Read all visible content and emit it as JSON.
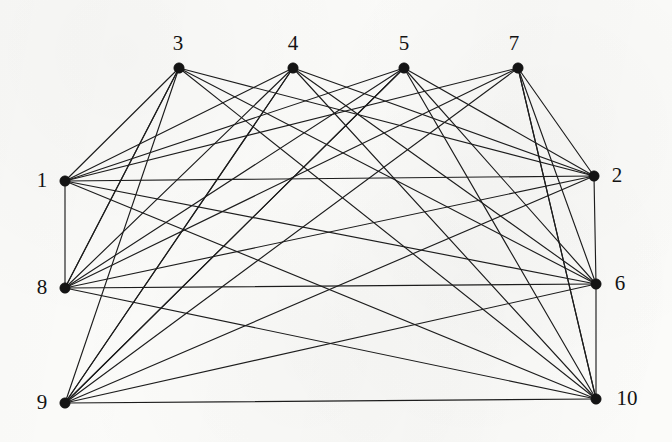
{
  "diagram": {
    "kind": "node-link-graph",
    "background_color": "#fbfbf9",
    "edge_color": "#1d1d1d",
    "vertex_color": "#141414",
    "vertex_radius": 5.2,
    "edge_width": 1.15,
    "label_font_size": 21,
    "width": 672,
    "height": 442
  },
  "chart_data": {
    "type": "scatter",
    "xlabel": "",
    "ylabel": "",
    "grid": false,
    "legend": "none",
    "xlim": [
      0,
      672
    ],
    "ylim": [
      0,
      442
    ],
    "node_count": 10,
    "edge_count": 40,
    "nodes": [
      {
        "id": "1",
        "label": "1",
        "x": 65,
        "y": 181,
        "label_x": 42,
        "label_y": 180,
        "degree": 8
      },
      {
        "id": "2",
        "label": "2",
        "x": 594,
        "y": 176,
        "label_x": 617,
        "label_y": 175,
        "degree": 8
      },
      {
        "id": "3",
        "label": "3",
        "x": 179,
        "y": 68,
        "label_x": 178,
        "label_y": 43,
        "degree": 6
      },
      {
        "id": "4",
        "label": "4",
        "x": 293,
        "y": 68,
        "label_x": 293,
        "label_y": 43,
        "degree": 8
      },
      {
        "id": "5",
        "label": "5",
        "x": 404,
        "y": 68,
        "label_x": 404,
        "label_y": 43,
        "degree": 8
      },
      {
        "id": "7",
        "label": "7",
        "x": 518,
        "y": 68,
        "label_x": 514,
        "label_y": 43,
        "degree": 8
      },
      {
        "id": "6",
        "label": "6",
        "x": 596,
        "y": 284,
        "label_x": 620,
        "label_y": 283,
        "degree": 8
      },
      {
        "id": "8",
        "label": "8",
        "x": 65,
        "y": 288,
        "label_x": 42,
        "label_y": 287,
        "degree": 8
      },
      {
        "id": "9",
        "label": "9",
        "x": 65,
        "y": 403,
        "label_x": 42,
        "label_y": 402,
        "degree": 8
      },
      {
        "id": "10",
        "label": "10",
        "x": 596,
        "y": 399,
        "label_x": 627,
        "label_y": 398,
        "degree": 8
      }
    ],
    "edges": [
      {
        "from": "1",
        "to": "2"
      },
      {
        "from": "1",
        "to": "3"
      },
      {
        "from": "1",
        "to": "4"
      },
      {
        "from": "1",
        "to": "5"
      },
      {
        "from": "1",
        "to": "7"
      },
      {
        "from": "1",
        "to": "6"
      },
      {
        "from": "1",
        "to": "10"
      },
      {
        "from": "8",
        "to": "3"
      },
      {
        "from": "8",
        "to": "4"
      },
      {
        "from": "8",
        "to": "5"
      },
      {
        "from": "8",
        "to": "7"
      },
      {
        "from": "8",
        "to": "2"
      },
      {
        "from": "8",
        "to": "6"
      },
      {
        "from": "8",
        "to": "10"
      },
      {
        "from": "9",
        "to": "3"
      },
      {
        "from": "9",
        "to": "4"
      },
      {
        "from": "9",
        "to": "5"
      },
      {
        "from": "9",
        "to": "7"
      },
      {
        "from": "9",
        "to": "2"
      },
      {
        "from": "9",
        "to": "6"
      },
      {
        "from": "9",
        "to": "10"
      },
      {
        "from": "3",
        "to": "2"
      },
      {
        "from": "3",
        "to": "6"
      },
      {
        "from": "3",
        "to": "10"
      },
      {
        "from": "4",
        "to": "2"
      },
      {
        "from": "4",
        "to": "6"
      },
      {
        "from": "4",
        "to": "10"
      },
      {
        "from": "5",
        "to": "2"
      },
      {
        "from": "5",
        "to": "6"
      },
      {
        "from": "5",
        "to": "10"
      },
      {
        "from": "7",
        "to": "2"
      },
      {
        "from": "7",
        "to": "6"
      },
      {
        "from": "7",
        "to": "10"
      },
      {
        "from": "4",
        "to": "9"
      },
      {
        "from": "5",
        "to": "9"
      },
      {
        "from": "1",
        "to": "8"
      },
      {
        "from": "2",
        "to": "6"
      },
      {
        "from": "6",
        "to": "10"
      },
      {
        "from": "3",
        "to": "8"
      },
      {
        "from": "7",
        "to": "10"
      }
    ]
  }
}
